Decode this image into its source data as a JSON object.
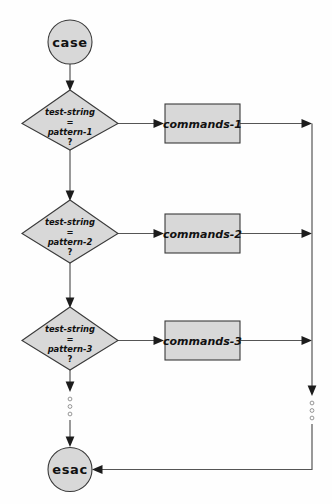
{
  "diagram": {
    "colors": {
      "node_fill": "#d8d8d8",
      "node_stroke": "#3a3a3a",
      "connector": "#555555",
      "arrow": "#1c1c1c",
      "background": "#fefefe"
    },
    "start_node": {
      "type": "terminal",
      "label": "case"
    },
    "end_node": {
      "type": "terminal",
      "label": "esac"
    },
    "branches": [
      {
        "decision": {
          "type": "decision",
          "line1": "test-string",
          "line2": "=",
          "line3": "pattern-1",
          "line4": "?"
        },
        "process": {
          "type": "process",
          "label": "commands-1"
        }
      },
      {
        "decision": {
          "type": "decision",
          "line1": "test-string",
          "line2": "=",
          "line3": "pattern-2",
          "line4": "?"
        },
        "process": {
          "type": "process",
          "label": "commands-2"
        }
      },
      {
        "decision": {
          "type": "decision",
          "line1": "test-string",
          "line2": "=",
          "line3": "pattern-3",
          "line4": "?"
        },
        "process": {
          "type": "process",
          "label": "commands-3"
        }
      }
    ],
    "continuation": {
      "left_ellipsis": "vertical-ellipsis",
      "right_ellipsis": "vertical-ellipsis"
    }
  }
}
